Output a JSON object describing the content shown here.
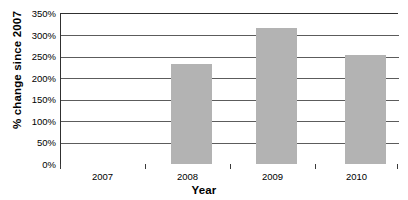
{
  "chart_data": {
    "type": "bar",
    "title": "",
    "xlabel": "Year",
    "ylabel": "% change since 2007",
    "categories": [
      "2007",
      "2008",
      "2009",
      "2010"
    ],
    "values": [
      0,
      233,
      318,
      255
    ],
    "value_unit": "%",
    "ylim": [
      0,
      350
    ],
    "ytick_values": [
      0,
      50,
      100,
      150,
      200,
      250,
      300,
      350
    ],
    "ytick_labels": [
      "0%",
      "50%",
      "100%",
      "150%",
      "200%",
      "250%",
      "300%",
      "350%"
    ],
    "grid": true,
    "grid_axis": "y",
    "legend": false,
    "legend_position": "none",
    "series": [
      {
        "name": "% change since 2007",
        "values": [
          0,
          233,
          318,
          255
        ]
      }
    ]
  },
  "style": {
    "bar_color": "#b3b3b3",
    "grid_color": "#5c5c5c",
    "axis_color": "#303030",
    "text_color": "#000000",
    "background": "#ffffff"
  }
}
